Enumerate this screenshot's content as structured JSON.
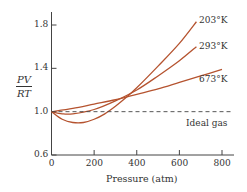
{
  "chart_data": {
    "type": "line",
    "title": "",
    "xlabel": "Pressure (atm)",
    "ylabel": "PV/RT",
    "ylabel_num": "PV",
    "ylabel_den": "RT",
    "xlim": [
      0,
      850
    ],
    "ylim": [
      0.6,
      1.9
    ],
    "xticks": [
      "0",
      "200",
      "400",
      "600",
      "800"
    ],
    "yticks": [
      "0.6",
      "1.0",
      "1.4",
      "1.8"
    ],
    "grid": false,
    "line_color": "#b5532f",
    "series": [
      {
        "name": "203°K",
        "x": [
          0,
          50,
          100,
          150,
          200,
          250,
          300,
          350,
          400,
          500,
          600,
          680
        ],
        "y": [
          1.0,
          0.93,
          0.9,
          0.9,
          0.93,
          0.98,
          1.05,
          1.13,
          1.22,
          1.42,
          1.63,
          1.83
        ]
      },
      {
        "name": "293°K",
        "x": [
          0,
          50,
          100,
          200,
          300,
          400,
          500,
          600,
          680
        ],
        "y": [
          1.0,
          0.98,
          0.98,
          1.02,
          1.1,
          1.2,
          1.33,
          1.47,
          1.6
        ]
      },
      {
        "name": "673°K",
        "x": [
          0,
          100,
          200,
          300,
          400,
          500,
          600,
          700,
          800
        ],
        "y": [
          1.0,
          1.03,
          1.07,
          1.11,
          1.16,
          1.21,
          1.27,
          1.33,
          1.39
        ]
      },
      {
        "name": "Ideal gas",
        "x": [
          0,
          850
        ],
        "y": [
          1.0,
          1.0
        ],
        "dashed": true
      }
    ],
    "annotations": [
      "203°K",
      "293°K",
      "673°K",
      "Ideal gas"
    ]
  }
}
